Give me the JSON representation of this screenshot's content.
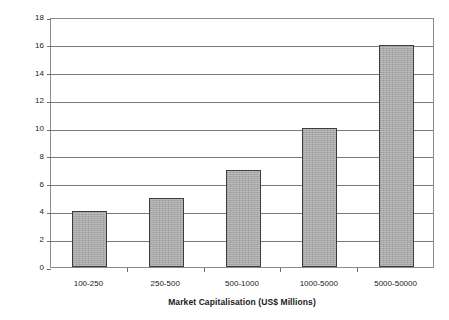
{
  "chart_data": {
    "type": "bar",
    "title": "",
    "categories": [
      "100-250",
      "250-500",
      "500-1000",
      "1000-5000",
      "5000-50000"
    ],
    "values": [
      4,
      5,
      7,
      10,
      16
    ],
    "xlabel": "Market Capitalisation (US$ Millions)",
    "ylabel": "Average Number of Analyst Estimates",
    "ylim": [
      0,
      18
    ],
    "yticks": [
      0,
      2,
      4,
      6,
      8,
      10,
      12,
      14,
      16,
      18
    ],
    "ytick_labels": [
      "0",
      "2",
      "4",
      "6",
      "8",
      "10",
      "12",
      "14",
      "16",
      "18"
    ],
    "grid": true,
    "legend": null,
    "colors": {
      "bar_fill": "#a9a9a9",
      "bar_border": "#3d3d3d",
      "gridline": "#7a7a7a",
      "axis": "#8c8c8c",
      "background": "#ffffff",
      "text": "#1a1a1a"
    }
  }
}
